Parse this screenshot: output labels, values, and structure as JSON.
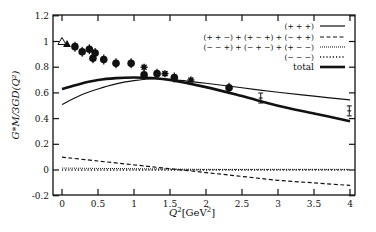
{
  "chart_data": {
    "type": "line",
    "title": "",
    "xlabel": "Q^2[GeV^2]",
    "ylabel": "G*_M/3G_D(Q^2)",
    "xlim": [
      -0.1,
      4.05
    ],
    "ylim": [
      -0.2,
      1.2
    ],
    "xticks": [
      0,
      0.5,
      1,
      1.5,
      2,
      2.5,
      3,
      3.5,
      4
    ],
    "xtick_labels": [
      "0",
      "0.5",
      "1",
      "1.5",
      "2",
      "2.5",
      "3",
      "3.5",
      "4"
    ],
    "yticks": [
      -0.2,
      0,
      0.2,
      0.4,
      0.6,
      0.8,
      1,
      1.2
    ],
    "ytick_labels": [
      "-0.2",
      "0",
      "0.2",
      "0.4",
      "0.6",
      "0.8",
      "1",
      "1.2"
    ],
    "grid": false,
    "legend_position": "upper right",
    "series": [
      {
        "name": "(+ + +)",
        "style": "solid-thin",
        "x": [
          0,
          0.25,
          0.5,
          0.75,
          1,
          1.25,
          1.5,
          2,
          2.5,
          3,
          3.5,
          4
        ],
        "values": [
          0.51,
          0.58,
          0.63,
          0.67,
          0.695,
          0.71,
          0.705,
          0.675,
          0.64,
          0.605,
          0.575,
          0.545
        ]
      },
      {
        "name": "(+ + −) + (+ − +) + (− + +)",
        "style": "dashed",
        "x": [
          0,
          0.5,
          1,
          1.5,
          2,
          2.5,
          3,
          3.5,
          4
        ],
        "values": [
          0.1,
          0.07,
          0.04,
          0.01,
          -0.02,
          -0.05,
          -0.08,
          -0.1,
          -0.12
        ]
      },
      {
        "name": "(− − +) + (− + −) + (+ − −)",
        "style": "dotted",
        "x": [
          0,
          1,
          2,
          3,
          4
        ],
        "values": [
          0.015,
          0.01,
          0.005,
          0.005,
          0.005
        ]
      },
      {
        "name": "(− − −)",
        "style": "dotted-sparse",
        "x": [
          0,
          1,
          2,
          3,
          4
        ],
        "values": [
          0.0,
          0.0,
          0.0,
          0.0,
          0.0
        ]
      },
      {
        "name": "total",
        "style": "solid-thick",
        "x": [
          0,
          0.25,
          0.5,
          0.75,
          1,
          1.25,
          1.5,
          2,
          2.5,
          3,
          3.5,
          4
        ],
        "values": [
          0.63,
          0.67,
          0.7,
          0.715,
          0.72,
          0.715,
          0.7,
          0.645,
          0.575,
          0.5,
          0.44,
          0.38
        ]
      }
    ],
    "data_points": [
      {
        "x": 0.0,
        "y": 1.0,
        "marker": "open-triangle"
      },
      {
        "x": 0.07,
        "y": 0.98,
        "marker": "filled-triangle"
      },
      {
        "x": 0.18,
        "y": 0.96,
        "marker": "filled-circle"
      },
      {
        "x": 0.28,
        "y": 0.92,
        "marker": "filled-circle"
      },
      {
        "x": 0.38,
        "y": 0.94,
        "marker": "filled-circle"
      },
      {
        "x": 0.46,
        "y": 0.91,
        "marker": "filled-circle"
      },
      {
        "x": 0.43,
        "y": 0.87,
        "marker": "filled-circle"
      },
      {
        "x": 0.58,
        "y": 0.86,
        "marker": "filled-circle"
      },
      {
        "x": 0.75,
        "y": 0.83,
        "marker": "filled-circle"
      },
      {
        "x": 0.96,
        "y": 0.83,
        "marker": "filled-circle"
      },
      {
        "x": 1.14,
        "y": 0.8,
        "marker": "star"
      },
      {
        "x": 1.14,
        "y": 0.74,
        "marker": "filled-circle"
      },
      {
        "x": 1.32,
        "y": 0.75,
        "marker": "filled-circle"
      },
      {
        "x": 1.43,
        "y": 0.75,
        "marker": "star"
      },
      {
        "x": 1.56,
        "y": 0.72,
        "marker": "filled-circle"
      },
      {
        "x": 1.79,
        "y": 0.7,
        "marker": "star"
      },
      {
        "x": 2.32,
        "y": 0.64,
        "marker": "filled-circle"
      },
      {
        "x": 2.76,
        "y": 0.56,
        "marker": "errorbar"
      },
      {
        "x": 3.99,
        "y": 0.46,
        "marker": "errorbar"
      }
    ]
  },
  "axes": {
    "xlabel_main": "Q",
    "xlabel_sup": "2",
    "xlabel_unit": "[GeV",
    "xlabel_unit_sup": "2",
    "xlabel_close": "]",
    "ylabel": "G*M/3GD(Q²)"
  },
  "legend": {
    "items": [
      {
        "label": "(+ + +)",
        "style": "solid-thin"
      },
      {
        "label": "(+ + −) + (+ − +) + (− + +)",
        "style": "dashed"
      },
      {
        "label": "(− − +) + (− + −) + (+ − −)",
        "style": "dotted"
      },
      {
        "label": "(− − −)",
        "style": "dotted-sparse"
      },
      {
        "label": "total",
        "style": "solid-thick"
      }
    ]
  }
}
